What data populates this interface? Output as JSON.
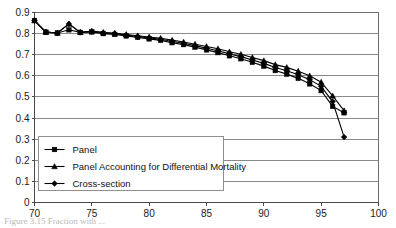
{
  "figure": {
    "caption": "Figure 3.15    Fraction with ..."
  },
  "legend": {
    "position": "inside-lower-left",
    "entries": [
      {
        "label": "Panel",
        "marker": "square"
      },
      {
        "label": "Panel Accounting for Differential Mortality",
        "marker": "triangle"
      },
      {
        "label": "Cross-section",
        "marker": "diamond"
      }
    ]
  },
  "chart_data": {
    "type": "line",
    "title": "",
    "xlabel": "",
    "ylabel": "",
    "xlim": [
      70,
      100
    ],
    "ylim": [
      0,
      0.9
    ],
    "xticks": [
      70,
      75,
      80,
      85,
      90,
      95,
      100
    ],
    "yticks": [
      0,
      0.1,
      0.2,
      0.3,
      0.4,
      0.5,
      0.6,
      0.7,
      0.8,
      0.9
    ],
    "ytick_labels": [
      "0",
      "0.1",
      "0.2",
      "0.3",
      "0.4",
      "0.5",
      "0.6",
      "0.7",
      "0.8",
      "0.9"
    ],
    "xtick_labels": [
      "70",
      "75",
      "80",
      "85",
      "90",
      "95",
      "100"
    ],
    "grid": "horizontal",
    "legend_position": "inside-lower-left",
    "x": [
      70,
      71,
      72,
      73,
      74,
      75,
      76,
      77,
      78,
      79,
      80,
      81,
      82,
      83,
      84,
      85,
      86,
      87,
      88,
      89,
      90,
      91,
      92,
      93,
      94,
      95,
      96,
      97
    ],
    "series": [
      {
        "name": "Panel",
        "marker": "square",
        "values": [
          0.862,
          0.807,
          0.803,
          0.818,
          0.806,
          0.808,
          0.8,
          0.796,
          0.789,
          0.782,
          0.775,
          0.768,
          0.757,
          0.748,
          0.736,
          0.723,
          0.71,
          0.695,
          0.681,
          0.664,
          0.646,
          0.625,
          0.608,
          0.588,
          0.562,
          0.53,
          0.455,
          0.425
        ]
      },
      {
        "name": "Panel Accounting for Differential Mortality",
        "marker": "triangle",
        "values": [
          0.862,
          0.807,
          0.803,
          0.846,
          0.806,
          0.812,
          0.806,
          0.802,
          0.796,
          0.79,
          0.784,
          0.778,
          0.769,
          0.76,
          0.75,
          0.739,
          0.728,
          0.714,
          0.702,
          0.687,
          0.672,
          0.653,
          0.64,
          0.622,
          0.6,
          0.57,
          0.505,
          0.435
        ]
      },
      {
        "name": "Cross-section",
        "marker": "diamond",
        "values": [
          0.862,
          0.807,
          0.803,
          0.846,
          0.806,
          0.81,
          0.804,
          0.8,
          0.793,
          0.786,
          0.78,
          0.773,
          0.763,
          0.754,
          0.743,
          0.731,
          0.719,
          0.704,
          0.691,
          0.675,
          0.659,
          0.639,
          0.624,
          0.605,
          0.582,
          0.55,
          0.478,
          0.31
        ]
      }
    ]
  }
}
